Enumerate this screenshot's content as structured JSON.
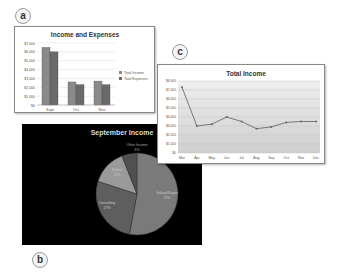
{
  "labels": {
    "a": "a",
    "b": "b",
    "c": "c"
  },
  "chart_data": [
    {
      "id": "a",
      "type": "bar",
      "title": "Income and Expenses",
      "xlabel": "",
      "ylabel": "",
      "categories": [
        "Sept",
        "Oct",
        "Nov"
      ],
      "series": [
        {
          "name": "Total Income",
          "values": [
            6500,
            2600,
            2700
          ],
          "color": "#8a8a8a"
        },
        {
          "name": "Total Expenses",
          "values": [
            6000,
            2300,
            2300
          ],
          "color": "#6a6a6a"
        }
      ],
      "ylim": [
        0,
        7000
      ],
      "yticks": [
        "$0",
        "$1,000",
        "$2,000",
        "$3,000",
        "$4,000",
        "$5,000",
        "$6,000",
        "$7,000"
      ],
      "grid": true,
      "legend": "right"
    },
    {
      "id": "b",
      "type": "pie",
      "title": "September Income",
      "slices": [
        {
          "label": "Salary/Wages",
          "pct": "53%",
          "value": 53,
          "color": "#7a7a7a"
        },
        {
          "label": "Consulting",
          "pct": "27%",
          "value": 27,
          "color": "#5e5e5e"
        },
        {
          "label": "Rental",
          "pct": "14%",
          "value": 14,
          "color": "#9a9a9a"
        },
        {
          "label": "Other Income",
          "pct": "6%",
          "value": 6,
          "color": "#505050"
        }
      ]
    },
    {
      "id": "c",
      "type": "line",
      "title": "Total Income",
      "categories": [
        "Mar",
        "Apr",
        "May",
        "Jun",
        "Jul",
        "Aug",
        "Sep",
        "Oct",
        "Nov",
        "Dec"
      ],
      "series": [
        {
          "name": "Total Income",
          "values": [
            7300,
            3000,
            3200,
            4000,
            3500,
            2700,
            2900,
            3400,
            3500,
            3500
          ],
          "color": "#777777"
        }
      ],
      "ylim": [
        0,
        8000
      ],
      "yticks": [
        "$0",
        "$1,000",
        "$2,000",
        "$3,000",
        "$4,000",
        "$5,000",
        "$6,000",
        "$7,000",
        "$8,000"
      ],
      "grid": true,
      "legend": "none"
    }
  ]
}
